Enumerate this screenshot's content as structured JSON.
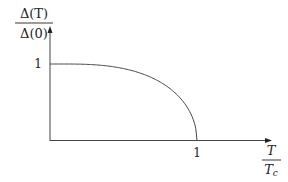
{
  "chart_data": {
    "type": "line",
    "title": "",
    "ylabel": {
      "numerator": "Δ(T)",
      "denominator": "Δ(0)"
    },
    "xlabel": {
      "numerator": "T",
      "denominator": "T_c"
    },
    "xlim": [
      0,
      1.35
    ],
    "ylim": [
      0,
      1.3
    ],
    "xticks": [
      {
        "value": 1,
        "label": "1"
      }
    ],
    "yticks": [
      {
        "value": 1,
        "label": "1"
      }
    ],
    "grid": false,
    "legend": null,
    "series": [
      {
        "name": "gap",
        "x": [
          0,
          0.1,
          0.2,
          0.3,
          0.4,
          0.5,
          0.6,
          0.7,
          0.8,
          0.85,
          0.9,
          0.95,
          0.98,
          1.0
        ],
        "values": [
          1.0,
          1.0,
          1.0,
          0.999,
          0.993,
          0.982,
          0.953,
          0.898,
          0.789,
          0.707,
          0.586,
          0.409,
          0.259,
          0.0
        ]
      }
    ]
  }
}
